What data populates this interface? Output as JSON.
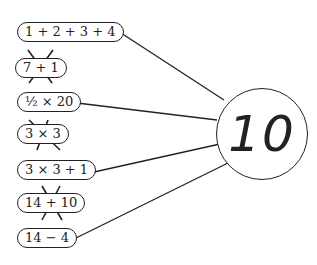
{
  "target": {
    "value": "10"
  },
  "expressions": [
    {
      "label": "1 + 2 + 3 + 4",
      "correct": true
    },
    {
      "label": "7 + 1",
      "correct": false
    },
    {
      "label": "½ × 20",
      "correct": true
    },
    {
      "label": "3 × 3",
      "correct": false
    },
    {
      "label": "3 × 3 + 1",
      "correct": true
    },
    {
      "label": "14 + 10",
      "correct": false
    },
    {
      "label": "14 − 4",
      "correct": true
    }
  ],
  "colors": {
    "ink": "#222222",
    "background": "#ffffff"
  }
}
